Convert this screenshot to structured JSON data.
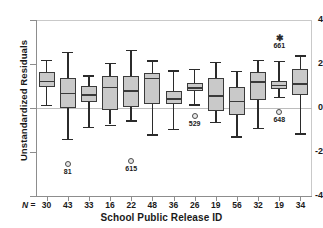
{
  "chart_data": {
    "type": "box",
    "title": "",
    "xlabel": "School Public Release ID",
    "ylabel": "Unstandardized Residuals",
    "ylim": [
      -4,
      4
    ],
    "yticks": [
      4,
      2,
      0,
      -2,
      -4
    ],
    "ytick_labels": [
      "4",
      "2",
      "0",
      "-2",
      "-4"
    ],
    "grid": false,
    "legend": "none",
    "reference_line": 0,
    "n_row_label": "N =",
    "categories": [
      "1",
      "2",
      "3",
      "4",
      "5",
      "6",
      "7",
      "8",
      "9",
      "10",
      "11",
      "12",
      "13"
    ],
    "n_values": [
      "30",
      "43",
      "33",
      "16",
      "22",
      "48",
      "36",
      "26",
      "19",
      "56",
      "32",
      "19",
      "34"
    ],
    "boxes": [
      {
        "n": "30",
        "min": 0.15,
        "q1": 0.95,
        "median": 1.25,
        "q3": 1.65,
        "max": 2.2
      },
      {
        "n": "43",
        "min": -1.4,
        "q1": 0.0,
        "median": 0.7,
        "q3": 1.35,
        "max": 2.55
      },
      {
        "n": "33",
        "min": -0.85,
        "q1": 0.25,
        "median": 0.62,
        "q3": 1.02,
        "max": 1.5
      },
      {
        "n": "16",
        "min": -0.75,
        "q1": -0.1,
        "median": 0.97,
        "q3": 1.45,
        "max": 2.05
      },
      {
        "n": "22",
        "min": -0.55,
        "q1": 0.05,
        "median": 0.8,
        "q3": 1.45,
        "max": 2.65
      },
      {
        "n": "48",
        "min": -1.2,
        "q1": 0.18,
        "median": 1.38,
        "q3": 1.6,
        "max": 2.18
      },
      {
        "n": "36",
        "min": -0.95,
        "q1": 0.18,
        "median": 0.45,
        "q3": 0.78,
        "max": 1.72
      },
      {
        "n": "26",
        "min": 0.18,
        "q1": 0.78,
        "median": 0.95,
        "q3": 1.15,
        "max": 1.78
      },
      {
        "n": "19",
        "min": -0.62,
        "q1": -0.12,
        "median": 0.57,
        "q3": 1.38,
        "max": 2.1
      },
      {
        "n": "56",
        "min": -1.28,
        "q1": -0.32,
        "median": 0.33,
        "q3": 0.95,
        "max": 1.7
      },
      {
        "n": "32",
        "min": -0.9,
        "q1": 0.35,
        "median": 1.22,
        "q3": 1.65,
        "max": 2.2
      },
      {
        "n": "19",
        "min": 0.52,
        "q1": 0.85,
        "median": 1.05,
        "q3": 1.22,
        "max": 2.15
      },
      {
        "n": "34",
        "min": -1.15,
        "q1": 0.58,
        "median": 1.12,
        "q3": 1.78,
        "max": 2.4
      }
    ],
    "outliers": [
      {
        "box": 2,
        "value": -2.55,
        "label": "81",
        "marker": "circle"
      },
      {
        "box": 5,
        "value": -2.42,
        "label": "615",
        "marker": "circle"
      },
      {
        "box": 8,
        "value": -0.38,
        "label": "529",
        "marker": "circle"
      },
      {
        "box": 12,
        "value": -0.18,
        "label": "648",
        "marker": "circle"
      },
      {
        "box": 12,
        "value": 3.18,
        "label": "661",
        "marker": "asterisk"
      }
    ]
  }
}
